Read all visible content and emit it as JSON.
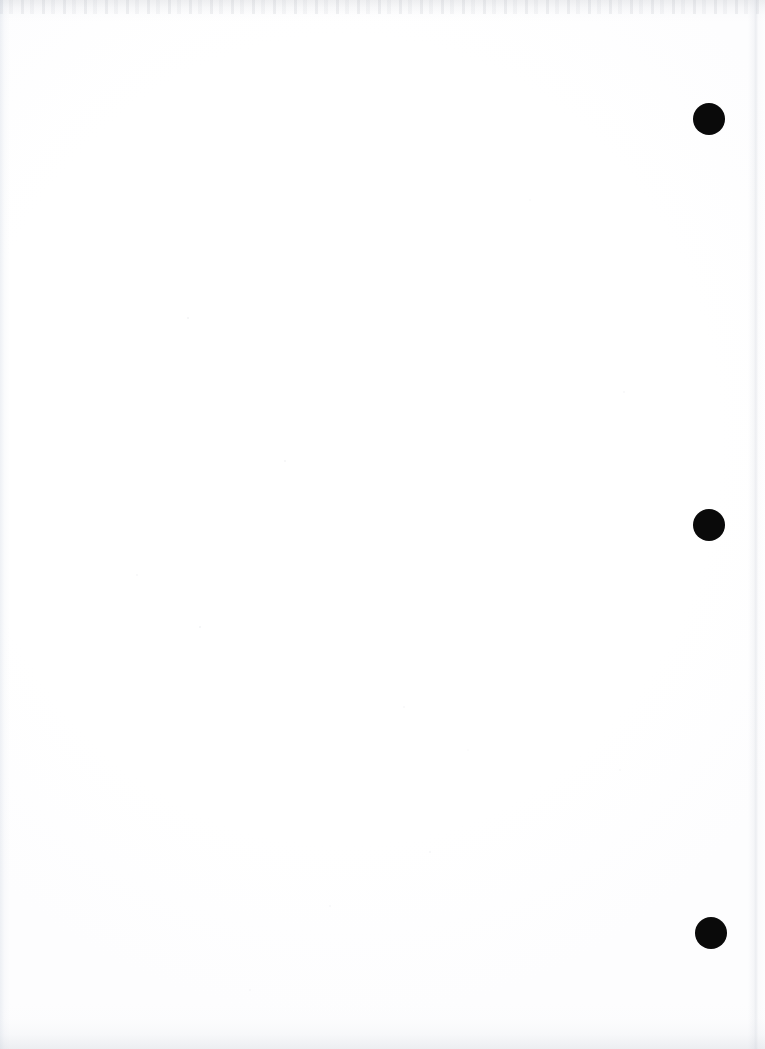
{
  "page": {
    "kind": "scanned-blank-page",
    "width": 765,
    "height": 1049,
    "background_color": "#ffffff",
    "visible_text": ""
  },
  "marks": {
    "shape": "filled-circle",
    "color": "#0a0a0a",
    "count": 3,
    "alignment": "vertical-column-right-margin",
    "items": [
      {
        "name": "dot-1",
        "cx": 709,
        "cy": 119,
        "diameter": 32
      },
      {
        "name": "dot-2",
        "cx": 709,
        "cy": 525,
        "diameter": 32
      },
      {
        "name": "dot-3",
        "cx": 711,
        "cy": 933,
        "diameter": 32
      }
    ]
  },
  "scan_artifacts": {
    "top_noise_band": {
      "name": "top-edge-noise",
      "height": 22,
      "color": "#a8acb4"
    },
    "left_edge_tint": {
      "name": "left-edge-tint",
      "width": 10,
      "color": "#cdd5e1"
    },
    "right_seam": {
      "name": "right-edge-seam",
      "x": 753,
      "color": "#d0d4dc"
    },
    "bottom_gradient": {
      "name": "bottom-edge-gradient",
      "height": 46,
      "color": "#c6cbd4"
    },
    "speckle": {
      "name": "paper-speckle",
      "color": "#bec2ca"
    }
  }
}
